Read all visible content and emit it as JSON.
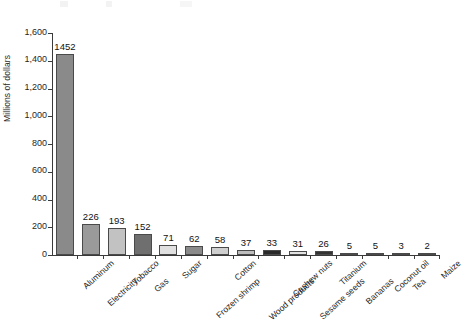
{
  "chart_data": {
    "type": "bar",
    "title": "",
    "xlabel": "",
    "ylabel": "Millions of dollars",
    "ylim": [
      0,
      1600
    ],
    "ytick_step": 200,
    "grid": false,
    "legend": null,
    "yticks": [
      "0",
      "200",
      "400",
      "600",
      "800",
      "1,000",
      "1,200",
      "1,400",
      "1,600"
    ],
    "categories": [
      "Aluminum",
      "Electricity",
      "Tobacco",
      "Gas",
      "Sugar",
      "Frozen shrimp",
      "Cotton",
      "Wood products",
      "Cashew nuts",
      "Sesame seeds",
      "Titanium",
      "Bananas",
      "Coconut oil",
      "Tea",
      "Maize"
    ],
    "values": [
      1452,
      226,
      193,
      152,
      71,
      62,
      58,
      37,
      33,
      31,
      26,
      5,
      5,
      3,
      2
    ],
    "value_labels": [
      "1452",
      "226",
      "193",
      "152",
      "71",
      "62",
      "58",
      "37",
      "33",
      "31",
      "26",
      "5",
      "5",
      "3",
      "2"
    ],
    "bar_colors": [
      "#8a8a8a",
      "#9a9a9a",
      "#c2c2c2",
      "#6f6f6f",
      "#e0e0e0",
      "#8a8a8a",
      "#cfcfcf",
      "#bdbdbd",
      "#2a2a2a",
      "#e2e2e2",
      "#333333",
      "#8d8d8d",
      "#8d8d8d",
      "#6a6a6a",
      "#6a6a6a"
    ],
    "axis_color": "#3a3a3a"
  }
}
